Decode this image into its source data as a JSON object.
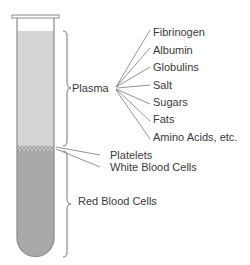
{
  "diagram": {
    "colors": {
      "plasma": "#d4d4d4",
      "red_cells": "#a9a9a9",
      "buffy": "#bdbdbd",
      "outline": "#8a8a8a",
      "text": "#3a3a3a"
    },
    "layers": [
      {
        "name": "Plasma",
        "label": "Plasma"
      },
      {
        "name": "Platelets",
        "label": "Platelets"
      },
      {
        "name": "White Blood Cells",
        "label": "White Blood Cells"
      },
      {
        "name": "Red Blood Cells",
        "label": "Red Blood Cells"
      }
    ],
    "plasma_components": [
      "Fibrinogen",
      "Albumin",
      "Globulins",
      "Salt",
      "Sugars",
      "Fats",
      "Amino Acids, etc."
    ]
  }
}
